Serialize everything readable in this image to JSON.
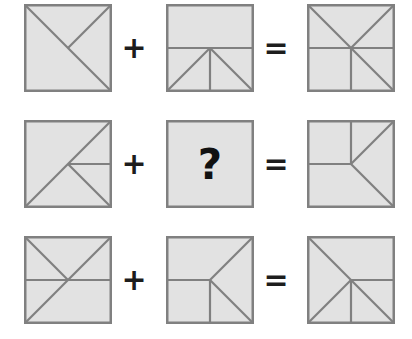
{
  "puzzle": {
    "colors": {
      "tile_fill": "#e2e2e2",
      "tile_stroke": "#808080",
      "operator_color": "#1d1d1d",
      "question_color": "#111111",
      "background": "#ffffff"
    },
    "operators": {
      "plus": "+",
      "equals": "="
    },
    "unknown_label": "?",
    "rows": [
      {
        "name": "row-1",
        "operand_a": {
          "name": "tile-row1-operand-a",
          "segments": [
            {
              "name": "diagonal-tl-br",
              "x1": 0,
              "y1": 0,
              "x2": 88,
              "y2": 88
            },
            {
              "name": "diagonal-tr-center",
              "x1": 88,
              "y1": 0,
              "x2": 44,
              "y2": 44
            }
          ]
        },
        "operand_b": {
          "name": "tile-row1-operand-b",
          "segments": [
            {
              "name": "horizontal-midline",
              "x1": 0,
              "y1": 44,
              "x2": 88,
              "y2": 44
            },
            {
              "name": "vertical-lower",
              "x1": 44,
              "y1": 44,
              "x2": 44,
              "y2": 88
            },
            {
              "name": "diagonal-center-bl",
              "x1": 44,
              "y1": 44,
              "x2": 0,
              "y2": 88
            },
            {
              "name": "diagonal-center-br",
              "x1": 44,
              "y1": 44,
              "x2": 88,
              "y2": 88
            }
          ]
        },
        "result": {
          "name": "tile-row1-result",
          "segments": [
            {
              "name": "diagonal-tl-br",
              "x1": 0,
              "y1": 0,
              "x2": 88,
              "y2": 88
            },
            {
              "name": "diagonal-tr-center",
              "x1": 88,
              "y1": 0,
              "x2": 44,
              "y2": 44
            },
            {
              "name": "horizontal-midline",
              "x1": 0,
              "y1": 44,
              "x2": 88,
              "y2": 44
            },
            {
              "name": "vertical-lower",
              "x1": 44,
              "y1": 44,
              "x2": 44,
              "y2": 88
            }
          ]
        }
      },
      {
        "name": "row-2",
        "operand_a": {
          "name": "tile-row2-operand-a",
          "segments": [
            {
              "name": "diagonal-bl-tr",
              "x1": 0,
              "y1": 88,
              "x2": 88,
              "y2": 0
            },
            {
              "name": "horizontal-center-right",
              "x1": 44,
              "y1": 44,
              "x2": 88,
              "y2": 44
            },
            {
              "name": "diagonal-center-br",
              "x1": 44,
              "y1": 44,
              "x2": 88,
              "y2": 88
            }
          ]
        },
        "operand_b": {
          "name": "tile-row2-unknown",
          "is_unknown": true,
          "segments": []
        },
        "result": {
          "name": "tile-row2-result",
          "segments": [
            {
              "name": "vertical-upper",
              "x1": 44,
              "y1": 0,
              "x2": 44,
              "y2": 44
            },
            {
              "name": "horizontal-left-center",
              "x1": 0,
              "y1": 44,
              "x2": 44,
              "y2": 44
            },
            {
              "name": "diagonal-center-tr",
              "x1": 44,
              "y1": 44,
              "x2": 88,
              "y2": 0
            },
            {
              "name": "diagonal-center-br",
              "x1": 44,
              "y1": 44,
              "x2": 88,
              "y2": 88
            }
          ]
        }
      },
      {
        "name": "row-3",
        "operand_a": {
          "name": "tile-row3-operand-a",
          "segments": [
            {
              "name": "diagonal-tl-center",
              "x1": 0,
              "y1": 0,
              "x2": 44,
              "y2": 44
            },
            {
              "name": "diagonal-tr-br-full",
              "x1": 88,
              "y1": 0,
              "x2": 0,
              "y2": 88
            },
            {
              "name": "horizontal-midline",
              "x1": 0,
              "y1": 44,
              "x2": 88,
              "y2": 44
            }
          ]
        },
        "operand_b": {
          "name": "tile-row3-operand-b",
          "segments": [
            {
              "name": "horizontal-left-center",
              "x1": 0,
              "y1": 44,
              "x2": 44,
              "y2": 44
            },
            {
              "name": "vertical-lower",
              "x1": 44,
              "y1": 44,
              "x2": 44,
              "y2": 88
            },
            {
              "name": "diagonal-center-tr",
              "x1": 44,
              "y1": 44,
              "x2": 88,
              "y2": 0
            },
            {
              "name": "diagonal-center-br",
              "x1": 44,
              "y1": 44,
              "x2": 88,
              "y2": 88
            }
          ]
        },
        "result": {
          "name": "tile-row3-result",
          "segments": [
            {
              "name": "diagonal-tl-br-full",
              "x1": 0,
              "y1": 0,
              "x2": 88,
              "y2": 88
            },
            {
              "name": "diagonal-center-bl",
              "x1": 44,
              "y1": 44,
              "x2": 0,
              "y2": 88
            },
            {
              "name": "horizontal-center-right",
              "x1": 44,
              "y1": 44,
              "x2": 88,
              "y2": 44
            },
            {
              "name": "vertical-lower",
              "x1": 44,
              "y1": 44,
              "x2": 44,
              "y2": 88
            }
          ]
        }
      }
    ]
  }
}
